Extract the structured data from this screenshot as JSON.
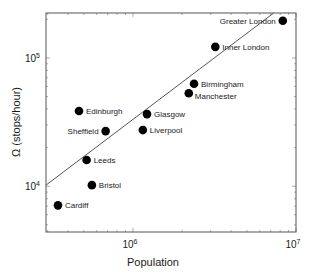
{
  "chart_data": {
    "type": "scatter",
    "title": "",
    "xlabel": "Population",
    "ylabel": "Ω (stops/hour)",
    "xscale": "log",
    "yscale": "log",
    "xlim": [
      293000,
      10000000
    ],
    "ylim": [
      4400,
      224000
    ],
    "grid": false,
    "legend": "none",
    "x_ticks": [
      {
        "value": 1000000,
        "base": "10",
        "exp": "6"
      },
      {
        "value": 10000000,
        "base": "10",
        "exp": "7"
      }
    ],
    "y_ticks": [
      {
        "value": 10000,
        "base": "10",
        "exp": "4"
      },
      {
        "value": 100000,
        "base": "10",
        "exp": "5"
      }
    ],
    "points": [
      {
        "label": "Greater London",
        "x": 8300000,
        "y": 195000,
        "label_side": "left"
      },
      {
        "label": "Inner London",
        "x": 3200000,
        "y": 122000,
        "label_side": "right"
      },
      {
        "label": "Birmingham",
        "x": 2370000,
        "y": 63000,
        "label_side": "right"
      },
      {
        "label": "Manchester",
        "x": 2200000,
        "y": 53000,
        "label_side": "right-below"
      },
      {
        "label": "Glasgow",
        "x": 1220000,
        "y": 36500,
        "label_side": "right"
      },
      {
        "label": "Liverpool",
        "x": 1150000,
        "y": 27400,
        "label_side": "right"
      },
      {
        "label": "Edinburgh",
        "x": 467000,
        "y": 38600,
        "label_side": "right"
      },
      {
        "label": "Sheffield",
        "x": 680000,
        "y": 26900,
        "label_side": "left"
      },
      {
        "label": "Leeds",
        "x": 520000,
        "y": 16000,
        "label_side": "right"
      },
      {
        "label": "Bristol",
        "x": 560000,
        "y": 10200,
        "label_side": "right"
      },
      {
        "label": "Cardiff",
        "x": 347000,
        "y": 7100,
        "label_side": "right"
      }
    ],
    "fit_line": {
      "description": "power-law fit",
      "x": [
        293000,
        7300000
      ],
      "y": [
        10200,
        224000
      ]
    }
  }
}
